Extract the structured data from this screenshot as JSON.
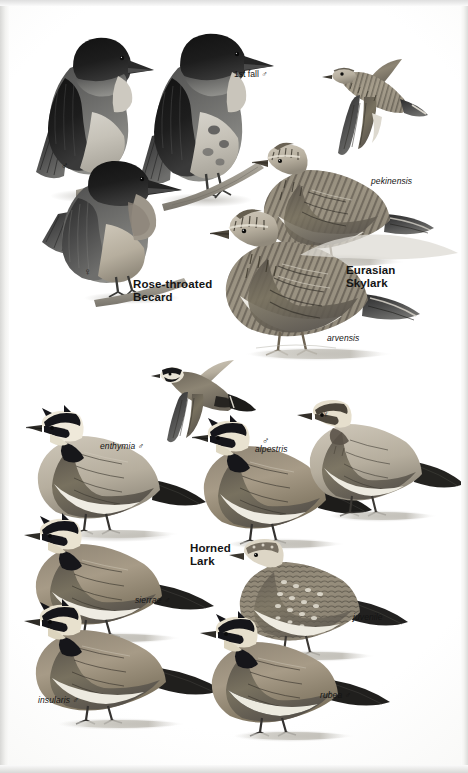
{
  "page": {
    "kind": "field-guide-plate",
    "orientation": "portrait",
    "background_color": "#ffffff",
    "ink_color": "#141414",
    "width": 468,
    "height": 773
  },
  "species": [
    {
      "id": "rose-throated-becard",
      "common_name_line1": "Rose-throated",
      "common_name_line2": "Becard",
      "common_name": "Rose-throated Becard",
      "figures": [
        {
          "id": "becard-male-perched-left",
          "label": "♂",
          "type": "sex-symbol"
        },
        {
          "id": "becard-1st-fall-male",
          "label": "1st fall ♂",
          "type": "plumage"
        },
        {
          "id": "becard-female-perched",
          "label": "♀",
          "type": "sex-symbol"
        }
      ]
    },
    {
      "id": "eurasian-skylark",
      "common_name_line1": "Eurasian",
      "common_name_line2": "Skylark",
      "common_name": "Eurasian Skylark",
      "figures": [
        {
          "id": "skylark-flight",
          "label": "",
          "type": "flight"
        },
        {
          "id": "skylark-pekinensis",
          "label": "pekinensis",
          "type": "subspecies"
        },
        {
          "id": "skylark-arvensis",
          "label": "arvensis",
          "type": "subspecies"
        }
      ]
    },
    {
      "id": "horned-lark",
      "common_name_line1": "Horned",
      "common_name_line2": "Lark",
      "common_name": "Horned Lark",
      "figures": [
        {
          "id": "lark-flight",
          "label": "",
          "type": "flight"
        },
        {
          "id": "lark-enthymia",
          "label": "enthymia ♂",
          "type": "subspecies"
        },
        {
          "id": "lark-alpestris",
          "label": "alpestris",
          "type": "subspecies"
        },
        {
          "id": "lark-alpestris-male-symbol",
          "label": "♂",
          "type": "sex-symbol"
        },
        {
          "id": "lark-female",
          "label": "♀",
          "type": "sex-symbol"
        },
        {
          "id": "lark-sierrae",
          "label": "sierrae ♂",
          "type": "subspecies"
        },
        {
          "id": "lark-juvenile",
          "label": "juvenile",
          "type": "age"
        },
        {
          "id": "lark-insularis",
          "label": "insularis ♂",
          "type": "subspecies"
        },
        {
          "id": "lark-rubea",
          "label": "rubea ♂",
          "type": "subspecies"
        }
      ]
    }
  ],
  "labels": {
    "first_fall_male": "1st fall ♂",
    "pekinensis": "pekinensis",
    "arvensis": "arvensis",
    "rose_throated": "Rose-throated",
    "becard": "Becard",
    "eurasian": "Eurasian",
    "skylark": "Skylark",
    "enthymia_male": "enthymia ♂",
    "alpestris": "alpestris",
    "horned": "Horned",
    "lark": "Lark",
    "sierrae_male": "sierrae ♂",
    "juvenile": "juvenile",
    "insularis_male": "insularis ♂",
    "rubea_male": "rubea ♂",
    "male_symbol": "♂",
    "female_symbol": "♀"
  }
}
